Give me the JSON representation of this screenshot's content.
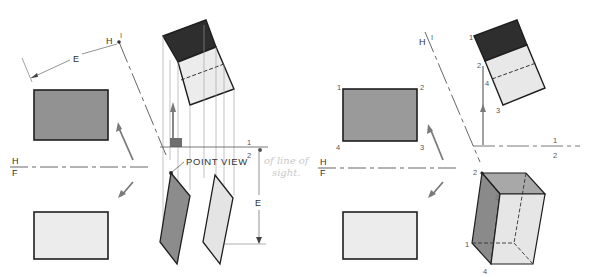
{
  "figure": {
    "left_panel": {
      "fold_line": {
        "top_label": "H",
        "bottom_label": "F"
      },
      "aux_fold_line_top": {
        "left_label": "H",
        "right_label": "I"
      },
      "distance_label_top": "E",
      "aux_fold_line_right": {
        "top_label": "1",
        "bottom_label": "2"
      },
      "distance_label_right": "E",
      "callout": "POINT VIEW",
      "callout_superscript": "2",
      "handwritten_note_line1": "of line of",
      "handwritten_note_line2": "sight."
    },
    "right_panel": {
      "fold_line": {
        "top_label": "H",
        "bottom_label": "F"
      },
      "aux_fold_line_top": {
        "left_label": "H",
        "right_label": "I"
      },
      "aux_fold_line_right": {
        "top_label": "1",
        "bottom_label": "2"
      },
      "top_view_corners": [
        "1",
        "2",
        "3",
        "4"
      ],
      "aux1_view_corners": [
        "1",
        "2",
        "3",
        "4"
      ],
      "aux2_view_corners": [
        "2",
        "3",
        "1",
        "4"
      ]
    },
    "colors": {
      "dark_face": "#2e2e2e",
      "medium_face": "#8f8f8f",
      "mid_face": "#a8a8a8",
      "light_face": "#e6e6e6",
      "line": "#1e1e1e",
      "projector": "#9a9a9a",
      "arrow": "#7a7a7a"
    }
  }
}
